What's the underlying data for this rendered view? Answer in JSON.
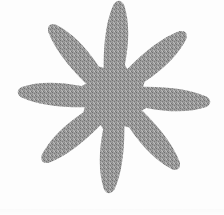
{
  "image": {
    "subject": "eight-pointed-star",
    "description": "Eight-pointed star silhouette",
    "background_color": "#fdfdfd",
    "fill_color": "#989898",
    "fill_texture": "dithered-halftone",
    "width": 224,
    "height": 215
  },
  "shape": {
    "type": "star",
    "points": 8,
    "center_x": 114,
    "center_y": 97,
    "outer_radius": 100,
    "inner_radius": 31,
    "rotation_deg": 3,
    "tip_style": "rounded",
    "clipped_edges": [
      "top"
    ],
    "tips": [
      {
        "name": "top",
        "x": 115,
        "y": -6
      },
      {
        "name": "upper-right",
        "x": 183,
        "y": 25
      },
      {
        "name": "right",
        "x": 212,
        "y": 95
      },
      {
        "name": "lower-right",
        "x": 184,
        "y": 170
      },
      {
        "name": "bottom",
        "x": 112,
        "y": 196
      },
      {
        "name": "lower-left",
        "x": 42,
        "y": 165
      },
      {
        "name": "left",
        "x": 16,
        "y": 92
      },
      {
        "name": "upper-left",
        "x": 42,
        "y": 27
      }
    ]
  }
}
